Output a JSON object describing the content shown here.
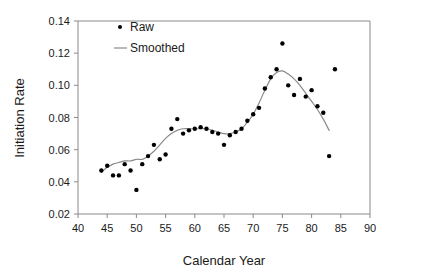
{
  "chart_data": {
    "type": "scatter",
    "title": "",
    "xlabel": "Calendar Year",
    "ylabel": "Initiation Rate",
    "xlim": [
      40,
      90
    ],
    "ylim": [
      0.02,
      0.14
    ],
    "xticks": [
      40,
      45,
      50,
      55,
      60,
      65,
      70,
      75,
      80,
      85,
      90
    ],
    "xtick_labels": [
      "40",
      "45",
      "50",
      "55",
      "60",
      "65",
      "70",
      "75",
      "80",
      "85",
      "90"
    ],
    "yticks": [
      0.02,
      0.04,
      0.06,
      0.08,
      0.1,
      0.12,
      0.14
    ],
    "ytick_labels": [
      "0.02",
      "0.04",
      "0.06",
      "0.08",
      "0.10",
      "0.12",
      "0.14"
    ],
    "grid": false,
    "legend_position": "top-left-inside",
    "series": [
      {
        "name": "Raw",
        "type": "scatter",
        "marker": "dot",
        "color": "#000000",
        "x": [
          44,
          45,
          46,
          47,
          48,
          49,
          50,
          51,
          52,
          53,
          54,
          55,
          56,
          57,
          58,
          59,
          60,
          61,
          62,
          63,
          64,
          65,
          66,
          67,
          68,
          69,
          70,
          71,
          72,
          73,
          74,
          75,
          76,
          77,
          78,
          79,
          80,
          81,
          82,
          83,
          84
        ],
        "y": [
          0.047,
          0.05,
          0.044,
          0.044,
          0.051,
          0.047,
          0.035,
          0.051,
          0.056,
          0.063,
          0.054,
          0.057,
          0.073,
          0.079,
          0.07,
          0.072,
          0.073,
          0.074,
          0.073,
          0.071,
          0.07,
          0.063,
          0.069,
          0.071,
          0.073,
          0.078,
          0.082,
          0.086,
          0.098,
          0.105,
          0.11,
          0.126,
          0.1,
          0.094,
          0.104,
          0.093,
          0.097,
          0.087,
          0.083,
          0.056,
          0.11
        ]
      },
      {
        "name": "Smoothed",
        "type": "line",
        "color": "#8a8a8a",
        "x": [
          44,
          45,
          46,
          47,
          48,
          49,
          50,
          51,
          52,
          53,
          54,
          55,
          56,
          57,
          58,
          59,
          60,
          61,
          62,
          63,
          64,
          65,
          66,
          67,
          68,
          69,
          70,
          71,
          72,
          73,
          74,
          75,
          76,
          77,
          78,
          79,
          80,
          81,
          82,
          83
        ],
        "y": [
          0.046,
          0.049,
          0.051,
          0.052,
          0.053,
          0.053,
          0.054,
          0.054,
          0.056,
          0.059,
          0.063,
          0.067,
          0.07,
          0.072,
          0.073,
          0.073,
          0.073,
          0.073,
          0.073,
          0.072,
          0.071,
          0.07,
          0.07,
          0.071,
          0.073,
          0.077,
          0.082,
          0.089,
          0.097,
          0.104,
          0.108,
          0.109,
          0.107,
          0.104,
          0.1,
          0.095,
          0.09,
          0.085,
          0.079,
          0.072
        ]
      }
    ],
    "legend": [
      {
        "label": "Raw",
        "marker": "dot",
        "color": "#000000"
      },
      {
        "label": "Smoothed",
        "marker": "line",
        "color": "#8a8a8a"
      }
    ]
  },
  "colors": {
    "axis": "#8a8a8a",
    "text": "#1a1a1a",
    "raw_marker": "#000000",
    "smoothed_line": "#8a8a8a",
    "background": "#ffffff"
  }
}
